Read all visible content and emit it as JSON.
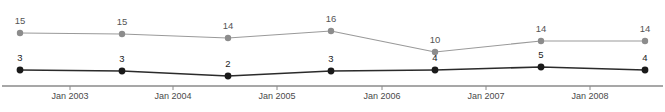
{
  "chart_data": {
    "type": "line",
    "title": "",
    "xlabel": "",
    "ylabel": "",
    "grid": false,
    "legend_position": "none",
    "x_tick_labels": [
      "Jan 2003",
      "Jan 2004",
      "Jan 2005",
      "Jan 2006",
      "Jan 2007",
      "Jan 2008"
    ],
    "x_tick_px": [
      70,
      173,
      277,
      382,
      486,
      590
    ],
    "x": [
      "Jul 2002",
      "Jul 2003",
      "Jul 2004",
      "Jul 2005",
      "Jul 2006",
      "Jul 2007",
      "Jul 2008"
    ],
    "x_px": [
      20,
      122,
      228,
      331,
      435,
      541,
      645
    ],
    "ylim": [
      0,
      18
    ],
    "series": [
      {
        "name": "upper-series",
        "color": "#9a9a9a",
        "marker_color": "#8c8c8c",
        "values": [
          15,
          15,
          14,
          16,
          10,
          14,
          14
        ],
        "y_px": [
          33,
          34,
          38,
          31,
          52,
          41,
          41
        ],
        "label_y_px": [
          24,
          25,
          29,
          22,
          43,
          32,
          32
        ]
      },
      {
        "name": "lower-series",
        "color": "#2b2b2b",
        "marker_color": "#1a1a1a",
        "values": [
          3,
          3,
          2,
          3,
          4,
          5,
          4
        ],
        "y_px": [
          70,
          71,
          76,
          71,
          70,
          67,
          70
        ],
        "label_y_px": [
          61,
          62,
          67,
          62,
          61,
          58,
          61
        ]
      }
    ],
    "axis": {
      "color": "#8a8a8a",
      "y_px": 86,
      "x_start_px": 2,
      "x_end_px": 663,
      "tick_length_px": 4,
      "tick_label_y_px": 99
    }
  }
}
